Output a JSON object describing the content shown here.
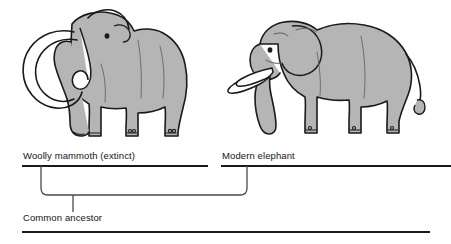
{
  "diagram": {
    "type": "cladogram",
    "background_color": "#ffffff",
    "line_color": "#1a1a1a",
    "bracket_color": "#4a4a4a",
    "animal_fill_color": "#b5b5b5",
    "animal_outline_color": "#1a1a1a",
    "tusk_fill_color": "#fdfdfd"
  },
  "illustrations": [
    {
      "id": "mammoth",
      "icon_name": "woolly-mammoth-illustration",
      "alt": "Woolly mammoth with large curved tusks and shaggy body, facing left"
    },
    {
      "id": "elephant",
      "icon_name": "modern-elephant-illustration",
      "alt": "Modern elephant with long trunk and large ears, facing left"
    }
  ],
  "branches": [
    {
      "id": "mammoth-branch",
      "label": "Woolly mammoth (extinct)"
    },
    {
      "id": "elephant-branch",
      "label": "Modern elephant"
    }
  ],
  "root": {
    "id": "common-ancestor",
    "label": "Common ancestor"
  }
}
